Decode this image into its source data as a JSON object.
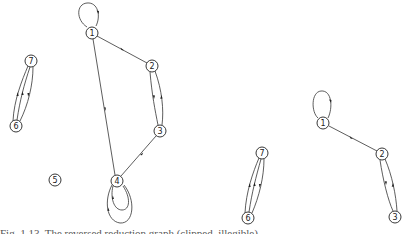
{
  "figure": {
    "graphs": [
      {
        "id": "graph-left",
        "nodes": [
          {
            "id": "1",
            "label": "1",
            "x": 92,
            "y": 33
          },
          {
            "id": "2",
            "label": "2",
            "x": 152,
            "y": 66
          },
          {
            "id": "3",
            "label": "3",
            "x": 160,
            "y": 131
          },
          {
            "id": "4",
            "label": "4",
            "x": 117,
            "y": 181
          },
          {
            "id": "5",
            "label": "5",
            "x": 55,
            "y": 180
          },
          {
            "id": "6",
            "label": "6",
            "x": 16,
            "y": 126
          },
          {
            "id": "7",
            "label": "7",
            "x": 31,
            "y": 61
          }
        ],
        "edges": [
          {
            "from": "1",
            "to": "1",
            "type": "self-loop"
          },
          {
            "from": "1",
            "to": "2"
          },
          {
            "from": "1",
            "to": "4"
          },
          {
            "from": "2",
            "to": "3"
          },
          {
            "from": "3",
            "to": "2"
          },
          {
            "from": "4",
            "to": "3"
          },
          {
            "from": "4",
            "to": "4",
            "type": "self-loop"
          },
          {
            "from": "4",
            "to": "4",
            "type": "self-loop"
          },
          {
            "from": "6",
            "to": "7"
          },
          {
            "from": "6",
            "to": "7"
          },
          {
            "from": "7",
            "to": "6"
          }
        ]
      },
      {
        "id": "graph-right",
        "nodes": [
          {
            "id": "1",
            "label": "1",
            "x": 323,
            "y": 123
          },
          {
            "id": "2",
            "label": "2",
            "x": 382,
            "y": 154
          },
          {
            "id": "3",
            "label": "3",
            "x": 395,
            "y": 217
          },
          {
            "id": "6",
            "label": "6",
            "x": 248,
            "y": 218
          },
          {
            "id": "7",
            "label": "7",
            "x": 262,
            "y": 153
          }
        ],
        "edges": [
          {
            "from": "1",
            "to": "1",
            "type": "self-loop"
          },
          {
            "from": "1",
            "to": "2"
          },
          {
            "from": "2",
            "to": "3"
          },
          {
            "from": "3",
            "to": "2"
          },
          {
            "from": "6",
            "to": "7"
          },
          {
            "from": "6",
            "to": "7"
          },
          {
            "from": "7",
            "to": "6"
          }
        ]
      }
    ],
    "labels": {
      "g1_n1": "1",
      "g1_n2": "2",
      "g1_n3": "3",
      "g1_n4": "4",
      "g1_n5": "5",
      "g1_n6": "6",
      "g1_n7": "7",
      "g2_n1": "1",
      "g2_n2": "2",
      "g2_n3": "3",
      "g2_n6": "6",
      "g2_n7": "7"
    },
    "caption": "Fig. 1.13.  The reversed reduction graph (clipped, illegible)"
  }
}
